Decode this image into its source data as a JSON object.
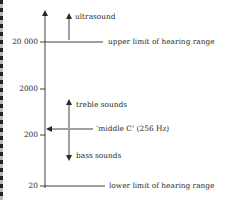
{
  "header_fragment": "",
  "axis": {
    "ticks": [
      {
        "label": "20 000",
        "value": 20000
      },
      {
        "label": "2000",
        "value": 2000
      },
      {
        "label": "200",
        "value": 200
      },
      {
        "label": "20",
        "value": 20
      }
    ]
  },
  "annotations": {
    "ultrasound": "ultrasound",
    "upper_limit": "upper limit of hearing range",
    "treble": "treble sounds",
    "middle_c": "‘middle C’ (256 Hz)",
    "bass": "bass sounds",
    "lower_limit": "lower limit of hearing range"
  },
  "colors": {
    "line": "#2a2a2a",
    "text": "#2a2a2a"
  }
}
